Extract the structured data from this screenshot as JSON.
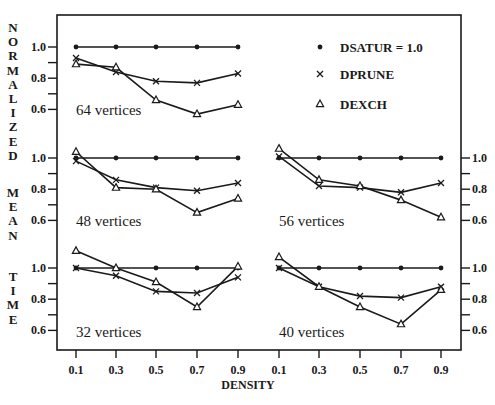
{
  "chart_data": {
    "type": "line",
    "xlabel": "DENSITY",
    "ylabel": "NORMALIZED MEAN TIME",
    "ylabel_words": [
      "NORMALIZED",
      "MEAN",
      "TIME"
    ],
    "x": [
      0.1,
      0.3,
      0.5,
      0.7,
      0.9
    ],
    "x_tick_labels": [
      "0.1",
      "0.3",
      "0.5",
      "0.7",
      "0.9"
    ],
    "y_tick_labels": [
      "1.0",
      "0.8",
      "0.6"
    ],
    "legend": [
      {
        "name": "DSATUR = 1.0",
        "marker": "dot"
      },
      {
        "name": "DPRUNE",
        "marker": "x"
      },
      {
        "name": "DEXCH",
        "marker": "triangle"
      }
    ],
    "panels": [
      {
        "label": "64 vertices",
        "position": "top-left",
        "series": [
          {
            "name": "DSATUR",
            "values": [
              1.0,
              1.0,
              1.0,
              1.0,
              1.0
            ]
          },
          {
            "name": "DPRUNE",
            "values": [
              0.93,
              0.84,
              0.78,
              0.77,
              0.83
            ]
          },
          {
            "name": "DEXCH",
            "values": [
              0.89,
              0.87,
              0.66,
              0.57,
              0.63
            ]
          }
        ]
      },
      {
        "label": "48 vertices",
        "position": "middle-left",
        "series": [
          {
            "name": "DSATUR",
            "values": [
              1.0,
              1.0,
              1.0,
              1.0,
              1.0
            ]
          },
          {
            "name": "DPRUNE",
            "values": [
              0.98,
              0.86,
              0.81,
              0.79,
              0.84
            ]
          },
          {
            "name": "DEXCH",
            "values": [
              1.04,
              0.81,
              0.8,
              0.65,
              0.74
            ]
          }
        ]
      },
      {
        "label": "56 vertices",
        "position": "middle-right",
        "series": [
          {
            "name": "DSATUR",
            "values": [
              1.0,
              1.0,
              1.0,
              1.0,
              1.0
            ]
          },
          {
            "name": "DPRUNE",
            "values": [
              1.01,
              0.82,
              0.81,
              0.78,
              0.84
            ]
          },
          {
            "name": "DEXCH",
            "values": [
              1.06,
              0.86,
              0.82,
              0.73,
              0.62
            ]
          }
        ]
      },
      {
        "label": "32 vertices",
        "position": "bottom-left",
        "series": [
          {
            "name": "DSATUR",
            "values": [
              1.0,
              1.0,
              1.0,
              1.0,
              1.0
            ]
          },
          {
            "name": "DPRUNE",
            "values": [
              1.0,
              0.95,
              0.85,
              0.84,
              0.94
            ]
          },
          {
            "name": "DEXCH",
            "values": [
              1.11,
              1.0,
              0.91,
              0.75,
              1.01
            ]
          }
        ]
      },
      {
        "label": "40 vertices",
        "position": "bottom-right",
        "series": [
          {
            "name": "DSATUR",
            "values": [
              1.0,
              1.0,
              1.0,
              1.0,
              1.0
            ]
          },
          {
            "name": "DPRUNE",
            "values": [
              1.0,
              0.88,
              0.82,
              0.81,
              0.88
            ]
          },
          {
            "name": "DEXCH",
            "values": [
              1.07,
              0.88,
              0.75,
              0.64,
              0.86
            ]
          }
        ]
      }
    ],
    "layout": {
      "frame": {
        "left": 57,
        "top": 15,
        "right": 461,
        "bottom": 350
      },
      "x_pixels_left": [
        76,
        116,
        156,
        197,
        238
      ],
      "x_pixels_right": [
        279,
        319,
        360,
        401,
        441
      ],
      "row_y_of_1_0": {
        "top": 47,
        "middle": 158,
        "bottom": 268
      },
      "px_per_unit": 156,
      "grid": false
    }
  }
}
